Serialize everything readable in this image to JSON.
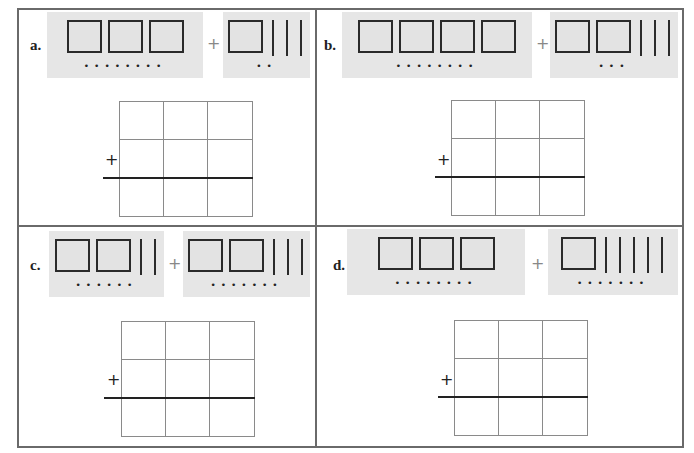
{
  "problems": [
    {
      "id": "a",
      "label": "a.",
      "addend1": {
        "hundreds": 3,
        "tens": 0,
        "ones_dots": 8
      },
      "operator": "+",
      "addend2": {
        "hundreds": 1,
        "tens": 3,
        "ones_dots": 2
      },
      "dots1": "••••••••",
      "dots2": "••",
      "answer_grid": {
        "rows": 3,
        "cols": 3,
        "plus_sign": "+"
      }
    },
    {
      "id": "b",
      "label": "b.",
      "addend1": {
        "hundreds": 4,
        "tens": 0,
        "ones_dots": 8
      },
      "operator": "+",
      "addend2": {
        "hundreds": 2,
        "tens": 3,
        "ones_dots": 3
      },
      "dots1": "••••••••",
      "dots2": "•••",
      "answer_grid": {
        "rows": 3,
        "cols": 3,
        "plus_sign": "+"
      }
    },
    {
      "id": "c",
      "label": "c.",
      "addend1": {
        "hundreds": 2,
        "tens": 2,
        "ones_dots": 6
      },
      "operator": "+",
      "addend2": {
        "hundreds": 2,
        "tens": 3,
        "ones_dots": 7
      },
      "dots1": "••••••",
      "dots2": "•••••••",
      "answer_grid": {
        "rows": 3,
        "cols": 3,
        "plus_sign": "+"
      }
    },
    {
      "id": "d",
      "label": "d.",
      "addend1": {
        "hundreds": 3,
        "tens": 0,
        "ones_dots": 8
      },
      "operator": "+",
      "addend2": {
        "hundreds": 1,
        "tens": 5,
        "ones_dots": 7
      },
      "dots1": "••••••••",
      "dots2": "•••••••",
      "answer_grid": {
        "rows": 3,
        "cols": 3,
        "plus_sign": "+"
      }
    }
  ],
  "colors": {
    "panel_bg": "#e6e6e6",
    "border": "#6a6a6a",
    "ink": "#222222"
  }
}
